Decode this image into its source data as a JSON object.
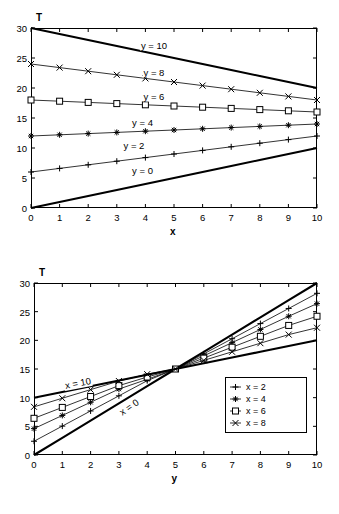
{
  "figures": [
    {
      "id": "plot-T-vs-x",
      "y_axis_label": "T",
      "x_axis_label": "x",
      "yticks": [
        0,
        5,
        10,
        15,
        20,
        25,
        30
      ],
      "xticks": [
        0,
        1,
        2,
        3,
        4,
        5,
        6,
        7,
        8,
        9,
        10
      ],
      "curve_labels": [
        {
          "text": "y = 10",
          "x": 4.3,
          "y": 27.2,
          "rot": "none"
        },
        {
          "text": "y = 8",
          "x": 4.3,
          "y": 22.6,
          "rot": "none"
        },
        {
          "text": "y = 6",
          "x": 4.3,
          "y": 18.6,
          "rot": "none"
        },
        {
          "text": "y = 4",
          "x": 3.9,
          "y": 14.4,
          "rot": "none"
        },
        {
          "text": "y = 2",
          "x": 3.6,
          "y": 10.5,
          "rot": "none"
        },
        {
          "text": "y = 0",
          "x": 3.9,
          "y": 6.3,
          "rot": "none"
        }
      ]
    },
    {
      "id": "plot-T-vs-y",
      "y_axis_label": "T",
      "x_axis_label": "y",
      "yticks": [
        0,
        5,
        10,
        15,
        20,
        25,
        30
      ],
      "xticks": [
        0,
        1,
        2,
        3,
        4,
        5,
        6,
        7,
        8,
        9,
        10
      ],
      "curve_labels": [
        {
          "text": "x = 10",
          "x": 1.55,
          "y": 12.6,
          "rot": "rot10"
        },
        {
          "text": "x = 0",
          "x": 3.35,
          "y": 8.3,
          "rot": "rot0"
        }
      ],
      "legend": {
        "entries": [
          {
            "label": "x = 2",
            "marker": "plus-marker"
          },
          {
            "label": "x = 4",
            "marker": "star-marker"
          },
          {
            "label": "x = 6",
            "marker": "square-marker"
          },
          {
            "label": "x = 8",
            "marker": "cross-marker"
          }
        ]
      }
    }
  ],
  "chart_data": [
    {
      "type": "line",
      "title": "",
      "xlabel": "x",
      "ylabel": "T",
      "xlim": [
        0,
        10
      ],
      "ylim": [
        0,
        30
      ],
      "xticks": [
        0,
        1,
        2,
        3,
        4,
        5,
        6,
        7,
        8,
        9,
        10
      ],
      "yticks": [
        0,
        5,
        10,
        15,
        20,
        25,
        30
      ],
      "grid": false,
      "legend": "inline-labels",
      "x": [
        0,
        1,
        2,
        3,
        4,
        5,
        6,
        7,
        8,
        9,
        10
      ],
      "series": [
        {
          "name": "y = 10",
          "marker": "none",
          "linewidth": "thick",
          "linestyle": "solid",
          "values": [
            30,
            29,
            28,
            27,
            26,
            25,
            24,
            23,
            22,
            21,
            20
          ]
        },
        {
          "name": "y = 8",
          "marker": "cross-marker",
          "linewidth": "thin",
          "linestyle": "solid",
          "values": [
            24,
            23.4,
            22.8,
            22.2,
            21.6,
            21,
            20.4,
            19.8,
            19.2,
            18.6,
            18
          ]
        },
        {
          "name": "y = 6",
          "marker": "square-marker",
          "linewidth": "thin",
          "linestyle": "solid",
          "values": [
            18,
            17.8,
            17.6,
            17.4,
            17.2,
            17,
            16.8,
            16.6,
            16.4,
            16.2,
            16
          ]
        },
        {
          "name": "y = 4",
          "marker": "star-marker",
          "linewidth": "thin",
          "linestyle": "solid",
          "values": [
            12,
            12.2,
            12.4,
            12.6,
            12.8,
            13,
            13.2,
            13.4,
            13.6,
            13.8,
            14
          ]
        },
        {
          "name": "y = 2",
          "marker": "plus-marker",
          "linewidth": "thin",
          "linestyle": "solid",
          "values": [
            6,
            6.6,
            7.2,
            7.8,
            8.4,
            9,
            9.6,
            10.2,
            10.8,
            11.4,
            12
          ]
        },
        {
          "name": "y = 0",
          "marker": "none",
          "linewidth": "thick",
          "linestyle": "solid",
          "values": [
            0,
            1,
            2,
            3,
            4,
            5,
            6,
            7,
            8,
            9,
            10
          ]
        }
      ]
    },
    {
      "type": "line",
      "title": "",
      "xlabel": "y",
      "ylabel": "T",
      "xlim": [
        0,
        10
      ],
      "ylim": [
        0,
        30
      ],
      "xticks": [
        0,
        1,
        2,
        3,
        4,
        5,
        6,
        7,
        8,
        9,
        10
      ],
      "yticks": [
        0,
        5,
        10,
        15,
        20,
        25,
        30
      ],
      "grid": false,
      "legend": "box-lower-right",
      "x": [
        0,
        1,
        2,
        3,
        4,
        5,
        6,
        7,
        8,
        9,
        10
      ],
      "series": [
        {
          "name": "x = 0",
          "marker": "none",
          "linewidth": "thick",
          "linestyle": "solid",
          "values": [
            0,
            3,
            6,
            9,
            12,
            15,
            18,
            21,
            24,
            27,
            30
          ]
        },
        {
          "name": "x = 2",
          "marker": "plus-marker",
          "linewidth": "thin",
          "linestyle": "solid",
          "values": [
            2.4,
            5.04,
            7.68,
            10.32,
            12.96,
            15,
            17.64,
            20.28,
            22.92,
            25.56,
            28.2
          ]
        },
        {
          "name": "x = 4",
          "marker": "star-marker",
          "linewidth": "thin",
          "linestyle": "solid",
          "values": [
            4.6,
            6.9,
            9.2,
            11.5,
            13.2,
            15,
            17.3,
            19.6,
            21.9,
            24.2,
            26.4
          ]
        },
        {
          "name": "x = 6",
          "marker": "square-marker",
          "linewidth": "thin",
          "linestyle": "solid",
          "values": [
            6.4,
            8.3,
            10.2,
            12.1,
            13.6,
            15,
            16.9,
            18.8,
            20.7,
            22.6,
            24.2
          ]
        },
        {
          "name": "x = 8",
          "marker": "cross-marker",
          "linewidth": "thin",
          "linestyle": "solid",
          "values": [
            8.4,
            9.9,
            11.4,
            12.9,
            14.1,
            15,
            16.5,
            18,
            19.5,
            21,
            22.2
          ]
        },
        {
          "name": "x = 10",
          "marker": "none",
          "linewidth": "thick",
          "linestyle": "solid",
          "values": [
            10,
            11,
            12,
            13,
            14,
            15,
            16,
            17,
            18,
            19,
            20
          ]
        }
      ]
    }
  ]
}
